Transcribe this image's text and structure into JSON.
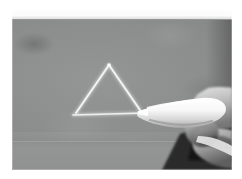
{
  "scene": {
    "title": "Hand holding chalk drawing a triangle on a grey board",
    "caption": "",
    "media_type": "photograph",
    "color_mode": "grayscale"
  },
  "frame": {
    "border_color": "#ffffff",
    "photo_left": 12,
    "photo_top": 10,
    "photo_width": 220,
    "photo_height": 160
  },
  "background": {
    "board_label": "chalkboard",
    "board_color": "#8c8d8d",
    "board_highlight_color": "#949595",
    "board_shadow_color": "#7e7f80",
    "top_strip_color": "#fbfbfb",
    "ledge_color": "#939494",
    "dark_wedge_color": "#141414"
  },
  "drawing": {
    "shape": "triangle",
    "stroke_color": "#f2f2f2",
    "stroke_width": 2,
    "apex": {
      "x": 97,
      "y": 54
    },
    "left_vertex": {
      "x": 64,
      "y": 103
    },
    "right_vertex": {
      "x": 128,
      "y": 100
    },
    "base_left": {
      "x": 62,
      "y": 105
    },
    "base_right": {
      "x": 132,
      "y": 103
    }
  },
  "chalk": {
    "label": "chalk-stick",
    "body_color": "#f6f6f6",
    "shadow_color": "#b8b8b8",
    "tip": {
      "x": 126,
      "y": 101
    },
    "tail": {
      "x": 205,
      "y": 126
    },
    "angle_deg": 19
  },
  "hand": {
    "label": "hand",
    "skin_light": "#dedede",
    "skin_mid": "#a9a9a9",
    "skin_dark": "#6e6e6e",
    "fingers": [
      "index-finger",
      "thumb",
      "middle-finger"
    ]
  }
}
